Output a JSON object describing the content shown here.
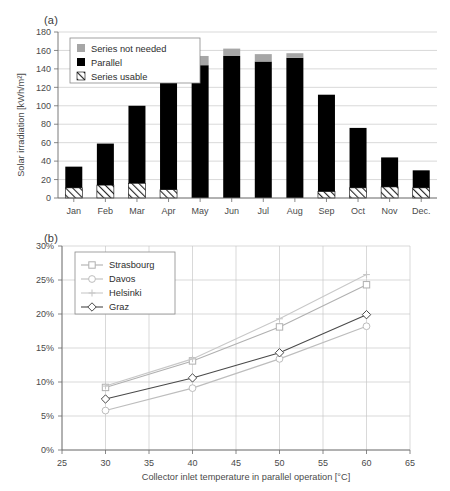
{
  "figure": {
    "panel_a_label": "(a)",
    "panel_b_label": "(b)"
  },
  "chart_data": [
    {
      "id": "panel_a",
      "type": "bar",
      "title": "",
      "xlabel": "",
      "ylabel": "Solar irradiation [kWh/m²]",
      "ylim": [
        0,
        180
      ],
      "ytick_step": 20,
      "ytick_labels": [
        "0",
        "20",
        "40",
        "60",
        "80",
        "100",
        "120",
        "140",
        "160",
        "180"
      ],
      "grid": true,
      "legend_position": "top-left",
      "stacked": true,
      "categories": [
        "Jan",
        "Feb",
        "Mar",
        "Apr",
        "May",
        "Jun",
        "Jul",
        "Aug",
        "Sep",
        "Oct",
        "Nov",
        "Dec."
      ],
      "series": [
        {
          "name": "Series usable",
          "style": "hatched",
          "color": "#ffffff",
          "values": [
            11,
            14,
            16,
            9,
            0,
            0,
            0,
            0,
            7,
            11,
            12,
            11
          ]
        },
        {
          "name": "Parallel",
          "style": "solid",
          "color": "#000000",
          "values": [
            23,
            45,
            84,
            119,
            144,
            154,
            148,
            152,
            105,
            65,
            32,
            19
          ]
        },
        {
          "name": "Series not needed",
          "style": "solid",
          "color": "#a6a6a6",
          "values": [
            0,
            0,
            0,
            0,
            10,
            8,
            8,
            5,
            0,
            0,
            0,
            0
          ]
        }
      ],
      "totals": [
        34,
        59,
        100,
        128,
        154,
        162,
        156,
        157,
        112,
        76,
        44,
        30
      ]
    },
    {
      "id": "panel_b",
      "type": "line",
      "title": "",
      "xlabel": "Collector inlet temperature in parallel operation [°C]",
      "ylabel": "Percentage for indirect use [%]",
      "xlim": [
        25,
        65
      ],
      "ylim": [
        0,
        30
      ],
      "xtick_step": 5,
      "ytick_step": 5,
      "xtick_labels": [
        "25",
        "30",
        "35",
        "40",
        "45",
        "50",
        "55",
        "60",
        "65"
      ],
      "ytick_labels": [
        "0%",
        "5%",
        "10%",
        "15%",
        "20%",
        "25%",
        "30%"
      ],
      "grid": true,
      "legend_position": "top-left",
      "x": [
        30,
        40,
        50,
        60
      ],
      "series": [
        {
          "name": "Strasbourg",
          "marker": "square",
          "color": "#b0b0b0",
          "values": [
            9.2,
            13.1,
            18.1,
            24.3
          ]
        },
        {
          "name": "Davos",
          "marker": "circle",
          "color": "#bdbdbd",
          "values": [
            5.8,
            9.1,
            13.4,
            18.2
          ]
        },
        {
          "name": "Helsinki",
          "marker": "plus",
          "color": "#c8c8c8",
          "values": [
            9.4,
            13.4,
            19.3,
            25.8
          ]
        },
        {
          "name": "Graz",
          "marker": "diamond",
          "color": "#4a4a4a",
          "values": [
            7.5,
            10.6,
            14.3,
            19.9
          ]
        }
      ]
    }
  ]
}
